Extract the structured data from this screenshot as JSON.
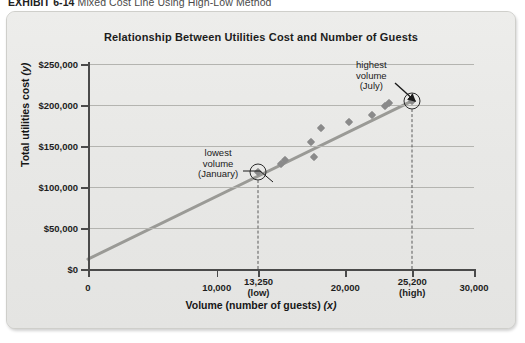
{
  "exhibit": {
    "label": "EXHIBIT 6-14",
    "title": "Mixed Cost Line Using High-Low Method"
  },
  "chart_data": {
    "type": "scatter",
    "title": "Relationship Between Utilities Cost and Number of Guests",
    "xlabel": "Volume (number of guests) (x)",
    "ylabel": "Total utilities cost (y)",
    "xlim": [
      0,
      30000
    ],
    "ylim": [
      0,
      250000
    ],
    "grid": true,
    "legend": "none",
    "x_ticks": [
      0,
      10000,
      20000,
      30000
    ],
    "x_tick_labels": [
      "0",
      "10,000",
      "20,000",
      "30,000"
    ],
    "y_ticks": [
      0,
      50000,
      100000,
      150000,
      200000,
      250000
    ],
    "y_tick_labels": [
      "$0",
      "$50,000",
      "$100,000",
      "$150,000",
      "$200,000",
      "$250,000"
    ],
    "x_special_ticks": [
      {
        "value": 13250,
        "label": "13,250",
        "sub": "(low)"
      },
      {
        "value": 25200,
        "label": "25,200",
        "sub": "(high)"
      }
    ],
    "points": [
      {
        "x": 13250,
        "y": 118000
      },
      {
        "x": 15000,
        "y": 128000
      },
      {
        "x": 15300,
        "y": 133000
      },
      {
        "x": 17300,
        "y": 155000
      },
      {
        "x": 17600,
        "y": 137000
      },
      {
        "x": 18100,
        "y": 172000
      },
      {
        "x": 20300,
        "y": 179000
      },
      {
        "x": 22100,
        "y": 188000
      },
      {
        "x": 23100,
        "y": 199000
      },
      {
        "x": 23400,
        "y": 203000
      },
      {
        "x": 25200,
        "y": 205000
      }
    ],
    "line": {
      "name": "mixed cost line",
      "x0": 0,
      "y0": 12000,
      "x1": 25200,
      "y1": 205000,
      "color": "#9a9a96"
    },
    "highlights": [
      {
        "x": 13250,
        "y": 118000,
        "role": "low"
      },
      {
        "x": 25200,
        "y": 205000,
        "role": "high"
      }
    ],
    "annotations": [
      {
        "id": "low",
        "lines": [
          "lowest",
          "volume",
          "(January)"
        ]
      },
      {
        "id": "high",
        "lines": [
          "highest",
          "volume",
          "(July)"
        ]
      }
    ]
  }
}
